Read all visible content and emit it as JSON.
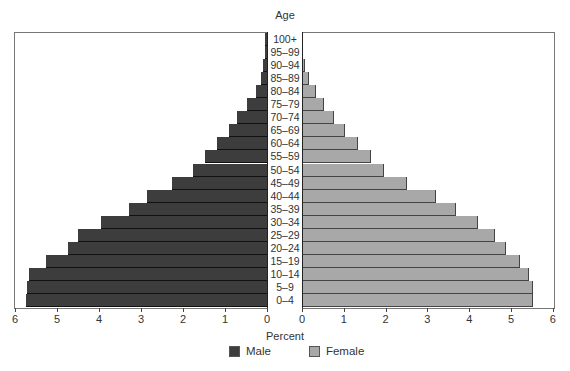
{
  "chart_data": {
    "type": "bar",
    "orientation": "horizontal",
    "subtype": "population-pyramid",
    "title": "Age",
    "xlabel": "Percent",
    "ylabel": "Age",
    "categories": [
      "100+",
      "95–99",
      "90–94",
      "85–89",
      "80–84",
      "75–79",
      "70–74",
      "65–69",
      "60–64",
      "55–59",
      "50–54",
      "45–49",
      "40–44",
      "35–39",
      "30–34",
      "25–29",
      "20–24",
      "15–19",
      "10–14",
      "5–9",
      "0–4"
    ],
    "series": [
      {
        "name": "Male",
        "color": "#3d3d3d",
        "side": "left",
        "values": [
          0.05,
          0.05,
          0.1,
          0.15,
          0.26,
          0.48,
          0.71,
          0.9,
          1.19,
          1.48,
          1.76,
          2.26,
          2.86,
          3.29,
          3.95,
          4.5,
          4.74,
          5.26,
          5.67,
          5.71,
          5.74
        ]
      },
      {
        "name": "Female",
        "color": "#a8a8a8",
        "side": "right",
        "values": [
          0.01,
          0.03,
          0.06,
          0.16,
          0.33,
          0.53,
          0.77,
          1.03,
          1.34,
          1.65,
          1.96,
          2.51,
          3.2,
          3.68,
          4.21,
          4.62,
          4.88,
          5.22,
          5.43,
          5.52,
          5.52
        ]
      }
    ],
    "xlim_left": [
      6,
      0
    ],
    "xlim_right": [
      0,
      6
    ],
    "left_ticks": [
      "6",
      "5",
      "4",
      "3",
      "2",
      "1",
      "0"
    ],
    "right_ticks": [
      "0",
      "1",
      "2",
      "3",
      "4",
      "5",
      "6"
    ],
    "legend_position": "bottom",
    "grid": false
  },
  "labels": {
    "age_title": "Age",
    "x_axis_title": "Percent",
    "legend_male": "Male",
    "legend_female": "Female"
  }
}
